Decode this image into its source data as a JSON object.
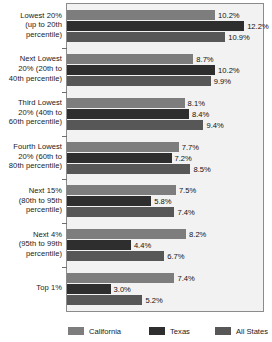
{
  "chart_data": {
    "type": "bar",
    "orientation": "horizontal",
    "title": "",
    "xlabel": "",
    "ylabel": "",
    "grid": false,
    "legend_position": "bottom",
    "value_suffix": "%",
    "xlim": [
      0,
      13.5
    ],
    "categories": [
      "Lowest 20% (up to 20th percentile)",
      "Next Lowest 20% (20th to 40th percentile)",
      "Third Lowest 20% (40th to 60th percentile)",
      "Fourth Lowest 20% (60th to 80th percentile)",
      "Next 15% (80th to 95th percentile)",
      "Next 4% (95th to 99th percentile)",
      "Top 1%"
    ],
    "category_lines": [
      [
        "Lowest 20%",
        "(up to 20th",
        "percentile)"
      ],
      [
        "Next Lowest",
        "20% (20th to",
        "40th percentile)"
      ],
      [
        "Third Lowest",
        "20% (40th to",
        "60th percentile)"
      ],
      [
        "Fourth Lowest",
        "20% (60th to",
        "80th percentile)"
      ],
      [
        "Next 15%",
        "(80th to 95th",
        "percentile)"
      ],
      [
        "Next 4%",
        "(95th to 99th",
        "percentile)"
      ],
      [
        "Top 1%"
      ]
    ],
    "series": [
      {
        "name": "California",
        "color": "#7d7d7d",
        "values": [
          10.2,
          8.7,
          8.1,
          7.7,
          7.5,
          8.2,
          7.4
        ],
        "labels": [
          "10.2%",
          "8.7%",
          "8.1%",
          "7.7%",
          "7.5%",
          "8.2%",
          "7.4%"
        ]
      },
      {
        "name": "Texas",
        "color": "#2e2e2e",
        "values": [
          12.2,
          10.2,
          8.4,
          7.2,
          5.8,
          4.4,
          3.0
        ],
        "labels": [
          "12.2%",
          "10.2%",
          "8.4%",
          "7.2%",
          "5.8%",
          "4.4%",
          "3.0%"
        ]
      },
      {
        "name": "All States",
        "color": "#575757",
        "values": [
          10.9,
          9.9,
          9.4,
          8.5,
          7.4,
          6.7,
          5.2
        ],
        "labels": [
          "10.9%",
          "9.9%",
          "9.4%",
          "8.5%",
          "7.4%",
          "6.7%",
          "5.2%"
        ]
      }
    ]
  },
  "legend": {
    "items": [
      {
        "label": "California",
        "color": "#7d7d7d"
      },
      {
        "label": "Texas",
        "color": "#2e2e2e"
      },
      {
        "label": "All States",
        "color": "#575757"
      }
    ]
  },
  "colors": {
    "plot_background": "#f2f2f2",
    "plot_border": "#8b8b8b",
    "text": "#1a1a1a",
    "california": "#7d7d7d",
    "texas": "#2e2e2e",
    "all_states": "#575757"
  }
}
